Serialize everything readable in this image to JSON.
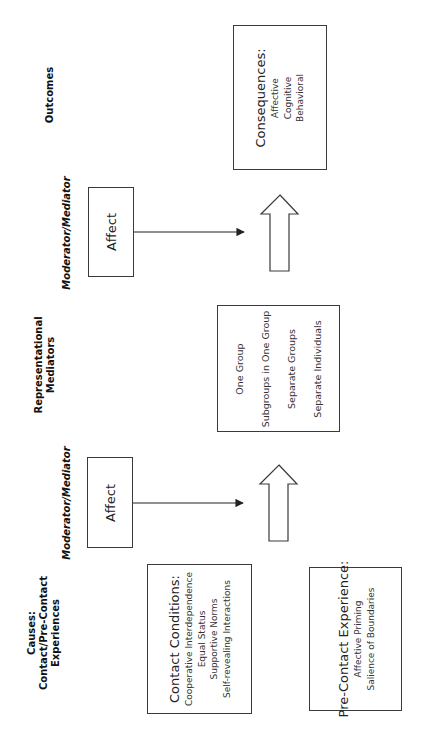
{
  "columns": {
    "outcomes": "Outcomes",
    "moderator_top": "Moderator/Mediator",
    "representational": [
      "Representational",
      "Mediators"
    ],
    "moderator_bottom": "Moderator/Mediator",
    "causes": [
      "Causes:",
      "Contact/Pre-Contact",
      "Experiences"
    ]
  },
  "boxes": {
    "consequences": {
      "title": "Consequences:",
      "items": [
        "Affective",
        "Cognitive",
        "Behavioral"
      ]
    },
    "affect_top": {
      "label": "Affect"
    },
    "representations": {
      "items": [
        "One Group",
        "Subgroups in One Group",
        "Separate Groups",
        "Separate Individuals"
      ]
    },
    "affect_bottom": {
      "label": "Affect"
    },
    "contact_conditions": {
      "title": "Contact Conditions:",
      "items": [
        "Cooperative Interdependence",
        "Equal Status",
        "Supportive Norms",
        "Self-revealing Interactions"
      ]
    },
    "pre_contact": {
      "title": "Pre-Contact Experience:",
      "items": [
        "Affective Priming",
        "Salience of Boundaries"
      ]
    }
  },
  "colors": {
    "line": "#3a3a3a",
    "text": "#1a1a1a",
    "background": "#ffffff"
  }
}
